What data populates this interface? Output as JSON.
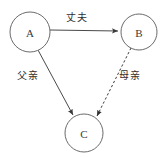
{
  "diagram": {
    "background_color": "#ffffff",
    "node_stroke_color": "#6b6b6b",
    "edge_stroke_color": "#4a4a4a",
    "nodes": [
      {
        "id": "A",
        "label": "A",
        "cx": 30,
        "cy": 32,
        "r": 20
      },
      {
        "id": "B",
        "label": "B",
        "cx": 139,
        "cy": 32,
        "r": 18
      },
      {
        "id": "C",
        "label": "C",
        "cx": 84,
        "cy": 133,
        "r": 19
      }
    ],
    "edges": [
      {
        "id": "a-to-b",
        "from": "A",
        "to": "B",
        "label": "丈夫",
        "style": "solid",
        "arrow": "end"
      },
      {
        "id": "a-to-c",
        "from": "A",
        "to": "C",
        "label": "父亲",
        "style": "solid",
        "arrow": "end"
      },
      {
        "id": "b-to-c",
        "from": "B",
        "to": "C",
        "label": "母亲",
        "style": "dashed",
        "arrow": "end"
      }
    ]
  }
}
